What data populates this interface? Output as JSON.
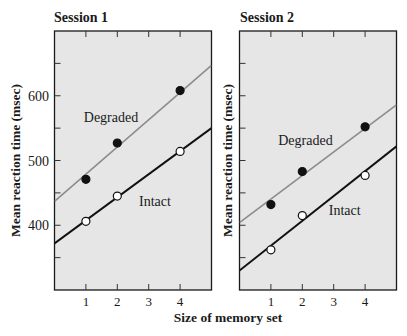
{
  "chart_data": [
    {
      "type": "line",
      "title": "Session 1",
      "xlabel": "Size of memory set",
      "ylabel": "Mean reaction time (msec)",
      "xlim": [
        0,
        5
      ],
      "ylim": [
        300,
        700
      ],
      "x_ticks": [
        1,
        2,
        3,
        4
      ],
      "x_tick_labels": [
        "1",
        "2",
        "3",
        "4"
      ],
      "y_ticks": [
        350,
        400,
        450,
        500,
        550,
        600,
        650
      ],
      "y_tick_labels": [
        "",
        "400",
        "",
        "500",
        "",
        "600",
        ""
      ],
      "grid": false,
      "series": [
        {
          "name": "Degraded",
          "marker": "filled-circle",
          "line_color": "#8c8c8c",
          "x": [
            1,
            2,
            4
          ],
          "values": [
            471,
            527,
            608
          ],
          "fit_line": {
            "x": [
              0,
              5
            ],
            "y": [
              437,
              647
            ]
          },
          "label_position": {
            "x": 1.8,
            "y": 567
          }
        },
        {
          "name": "Intact",
          "marker": "open-circle",
          "line_color": "#111111",
          "x": [
            1,
            2,
            4
          ],
          "values": [
            406,
            445,
            514
          ],
          "fit_line": {
            "x": [
              0,
              5
            ],
            "y": [
              372,
              550
            ]
          },
          "label_position": {
            "x": 3.2,
            "y": 437
          }
        }
      ]
    },
    {
      "type": "line",
      "title": "Session 2",
      "xlabel": "Size of memory set",
      "ylabel": "Mean reaction time (msec)",
      "xlim": [
        0,
        5
      ],
      "ylim": [
        300,
        700
      ],
      "x_ticks": [
        1,
        2,
        3,
        4
      ],
      "x_tick_labels": [
        "1",
        "2",
        "3",
        "4"
      ],
      "y_ticks": [
        350,
        400,
        450,
        500,
        550,
        600,
        650
      ],
      "y_tick_labels": [
        "",
        "",
        "",
        "",
        "",
        "",
        ""
      ],
      "grid": false,
      "series": [
        {
          "name": "Degraded",
          "marker": "filled-circle",
          "line_color": "#8c8c8c",
          "x": [
            1,
            2,
            4
          ],
          "values": [
            432,
            483,
            552
          ],
          "fit_line": {
            "x": [
              0,
              5
            ],
            "y": [
              404,
              586
            ]
          },
          "label_position": {
            "x": 2.1,
            "y": 531
          }
        },
        {
          "name": "Intact",
          "marker": "open-circle",
          "line_color": "#111111",
          "x": [
            1,
            2,
            4
          ],
          "values": [
            362,
            415,
            477
          ],
          "fit_line": {
            "x": [
              0,
              5
            ],
            "y": [
              330,
              522
            ]
          },
          "label_position": {
            "x": 3.35,
            "y": 423
          }
        }
      ]
    }
  ],
  "shared_xlabel": "Size of memory set",
  "colors": {
    "panel_fill": "#e6e6e6",
    "degraded_line": "#8c8c8c",
    "intact_line": "#111111",
    "marker_fill_degraded": "#111111",
    "marker_fill_intact": "#ffffff"
  }
}
